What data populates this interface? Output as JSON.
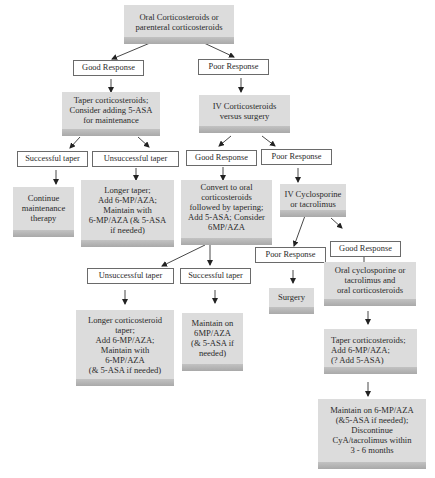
{
  "diagram": {
    "nodes": [
      {
        "id": "start",
        "type": "action",
        "text": "Oral Corticosteroids or parenteral corticosteroids"
      },
      {
        "id": "good1",
        "type": "outcome",
        "text": "Good Response"
      },
      {
        "id": "poor1",
        "type": "outcome",
        "text": "Poor Response"
      },
      {
        "id": "taper1",
        "type": "action",
        "text": "Taper corticosteroids; Consider adding 5-ASA for maintenance"
      },
      {
        "id": "ivsteroid",
        "type": "action",
        "text": "IV Corticosteroids versus surgery"
      },
      {
        "id": "succ1",
        "type": "outcome",
        "text": "Successful taper"
      },
      {
        "id": "unsucc1",
        "type": "outcome",
        "text": "Unsuccessful taper"
      },
      {
        "id": "good2",
        "type": "outcome",
        "text": "Good Response"
      },
      {
        "id": "poor2",
        "type": "outcome",
        "text": "Poor Response"
      },
      {
        "id": "continue",
        "type": "action",
        "text": "Continue maintenance therapy"
      },
      {
        "id": "longer1",
        "type": "action",
        "text": "Longer taper; Add 6-MP/AZA; Maintain with 6-MP/AZA (& 5-ASA if needed)"
      },
      {
        "id": "convert",
        "type": "action",
        "text": "Convert to oral corticosteroids followed by tapering; Add 5-ASA; Consider 6MP/AZA"
      },
      {
        "id": "ivcyclo",
        "type": "action",
        "text": "IV Cyclosporine or tacrolimus"
      },
      {
        "id": "poor3",
        "type": "outcome",
        "text": "Poor Response"
      },
      {
        "id": "good3",
        "type": "outcome",
        "text": "Good Response"
      },
      {
        "id": "unsucc2",
        "type": "outcome",
        "text": "Unsuccessful taper"
      },
      {
        "id": "succ2",
        "type": "outcome",
        "text": "Successful taper"
      },
      {
        "id": "surgery",
        "type": "action",
        "text": "Surgery"
      },
      {
        "id": "oralcyclo",
        "type": "action",
        "text": "Oral cyclosporine or tacrolimus and oral corticosteroids"
      },
      {
        "id": "longer2",
        "type": "action",
        "text": "Longer corticosteroid taper; Add 6-MP/AZA; Maintain with 6-MP/AZA (& 5-ASA if needed)"
      },
      {
        "id": "maintain6mp",
        "type": "action",
        "text": "Maintain on 6MP/AZA (& 5-ASA if needed)"
      },
      {
        "id": "taper2",
        "type": "action",
        "text": "Taper corticosteroids; Add 6-MP/AZA; (? Add 5-ASA)"
      },
      {
        "id": "final",
        "type": "action",
        "text": "Maintain on 6-MP/AZA (&5-ASA if needed); Discontinue CyA/tacrolimus within 3 - 6 months"
      }
    ],
    "lines": {
      "start": [
        "Oral Corticosteroids or",
        "parenteral corticosteroids"
      ],
      "good1": "Good Response",
      "poor1": "Poor Response",
      "taper1": [
        "Taper corticosteroids;",
        "Consider adding 5-ASA",
        "for maintenance"
      ],
      "ivsteroid": [
        "IV Corticosteroids",
        "versus surgery"
      ],
      "succ1": "Successful taper",
      "unsucc1": "Unsuccessful taper",
      "good2": "Good Response",
      "poor2": "Poor Response",
      "continue": [
        "Continue",
        "maintenance",
        "therapy"
      ],
      "longer1": [
        "Longer taper;",
        "Add 6-MP/AZA;",
        "Maintain with",
        "6-MP/AZA (& 5-ASA",
        "if needed)"
      ],
      "convert": [
        "Convert to oral",
        "corticosteroids",
        "followed by tapering;",
        "Add 5-ASA; Consider",
        "6MP/AZA"
      ],
      "ivcyclo": [
        "IV Cyclosporine",
        "or  tacrolimus"
      ],
      "poor3": "Poor Response",
      "good3": "Good Response",
      "unsucc2": "Unsuccessful taper",
      "succ2": "Successful taper",
      "surgery": "Surgery",
      "oralcyclo": [
        "Oral cyclosporine or",
        "tacrolimus and",
        "oral corticosteroids"
      ],
      "longer2": [
        "Longer corticosteroid",
        "taper;",
        "Add 6-MP/AZA;",
        "Maintain with",
        "6-MP/AZA",
        "(& 5-ASA if needed)"
      ],
      "maintain6mp": [
        "Maintain on",
        "6MP/AZA",
        "(& 5-ASA if",
        "needed)"
      ],
      "taper2": [
        "Taper corticosteroids;",
        "Add 6-MP/AZA;",
        "(? Add 5-ASA)"
      ],
      "final": [
        "Maintain on  6-MP/AZA",
        "(&5-ASA if needed);",
        "Discontinue",
        "CyA/tacrolimus within",
        "3 - 6 months"
      ]
    },
    "edges": [
      [
        "start",
        "good1"
      ],
      [
        "start",
        "poor1"
      ],
      [
        "good1",
        "taper1"
      ],
      [
        "poor1",
        "ivsteroid"
      ],
      [
        "taper1",
        "succ1"
      ],
      [
        "taper1",
        "unsucc1"
      ],
      [
        "ivsteroid",
        "good2"
      ],
      [
        "ivsteroid",
        "poor2"
      ],
      [
        "succ1",
        "continue"
      ],
      [
        "unsucc1",
        "longer1"
      ],
      [
        "good2",
        "convert"
      ],
      [
        "poor2",
        "ivcyclo"
      ],
      [
        "ivcyclo",
        "poor3"
      ],
      [
        "ivcyclo",
        "good3"
      ],
      [
        "convert",
        "unsucc2"
      ],
      [
        "convert",
        "succ2"
      ],
      [
        "poor3",
        "surgery"
      ],
      [
        "good3",
        "oralcyclo"
      ],
      [
        "unsucc2",
        "longer2"
      ],
      [
        "succ2",
        "maintain6mp"
      ],
      [
        "oralcyclo",
        "taper2"
      ],
      [
        "taper2",
        "final"
      ]
    ],
    "colors": {
      "action_box": "#dcdcdc",
      "action_box_bottom": "#b0b0b0",
      "outcome_border": "#6a6a6a",
      "arrow": "#222222"
    }
  }
}
